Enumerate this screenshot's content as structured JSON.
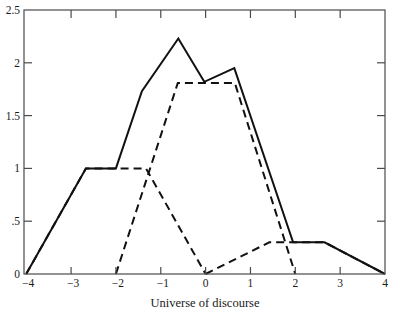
{
  "chart_data": {
    "type": "line",
    "title": "",
    "xlabel": "Universe of discourse",
    "ylabel": "",
    "xlim": [
      -4.05,
      4
    ],
    "ylim": [
      0,
      2.5
    ],
    "grid": false,
    "legend": null,
    "x_ticks": [
      -4,
      -3,
      -2,
      -1,
      0,
      1,
      2,
      3,
      4
    ],
    "x_tick_labels": [
      "−4",
      "−3",
      "−2",
      "−1",
      "0",
      "1",
      "2",
      "3",
      "4"
    ],
    "y_ticks": [
      0,
      0.5,
      1,
      1.5,
      2,
      2.5
    ],
    "y_tick_labels": [
      "0",
      ".5",
      "1",
      "1.5",
      "2",
      "2.5"
    ],
    "series": [
      {
        "name": "dashed-set-1",
        "style": "dashed",
        "points": [
          [
            -4,
            0
          ],
          [
            -2.67,
            1
          ],
          [
            -1.33,
            1
          ],
          [
            0,
            0
          ]
        ]
      },
      {
        "name": "dashed-set-2",
        "style": "dashed",
        "points": [
          [
            -2,
            0
          ],
          [
            -0.62,
            1.81
          ],
          [
            0.65,
            1.81
          ],
          [
            2,
            0
          ]
        ]
      },
      {
        "name": "dashed-set-3",
        "style": "dashed",
        "points": [
          [
            0,
            0
          ],
          [
            1.42,
            0.3
          ],
          [
            2.65,
            0.3
          ],
          [
            4,
            0
          ]
        ]
      },
      {
        "name": "solid-combined",
        "style": "solid",
        "points": [
          [
            -4,
            0
          ],
          [
            -2.67,
            1
          ],
          [
            -2,
            1
          ],
          [
            -1.42,
            1.73
          ],
          [
            -0.61,
            2.23
          ],
          [
            -0.03,
            1.82
          ],
          [
            0.64,
            1.95
          ],
          [
            1.95,
            0.3
          ],
          [
            2.65,
            0.3
          ],
          [
            4,
            0
          ]
        ]
      }
    ]
  }
}
